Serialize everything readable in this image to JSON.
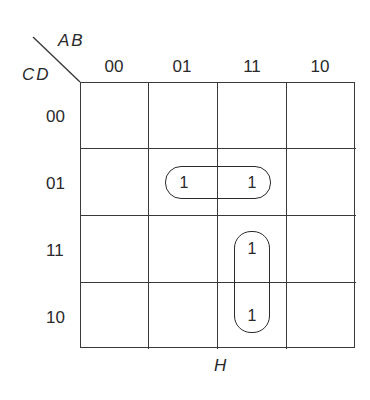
{
  "diagram": {
    "type": "karnaugh-map",
    "row_variables": "CD",
    "column_variables": "AB",
    "column_headers": [
      "00",
      "01",
      "11",
      "10"
    ],
    "row_headers": [
      "00",
      "01",
      "11",
      "10"
    ],
    "cells": [
      [
        "",
        "",
        "",
        ""
      ],
      [
        "",
        "1",
        "1",
        ""
      ],
      [
        "",
        "",
        "1",
        ""
      ],
      [
        "",
        "",
        "1",
        ""
      ]
    ],
    "groupings": [
      {
        "name": "horizontal-pair",
        "cells": [
          [
            1,
            1
          ],
          [
            1,
            2
          ]
        ],
        "orientation": "horizontal"
      },
      {
        "name": "vertical-pair",
        "cells": [
          [
            2,
            2
          ],
          [
            3,
            2
          ]
        ],
        "orientation": "vertical"
      }
    ],
    "output_label": "H"
  }
}
